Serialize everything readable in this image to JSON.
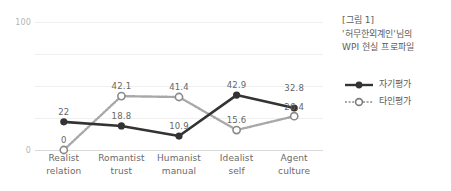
{
  "title": {
    "line1": "[그림 1]",
    "line2": "'허무한외계인'님의",
    "line3": "WPI 현실 프로파일"
  },
  "legend": [
    {
      "name": "self-evaluation",
      "label": "자기평가",
      "style": "solid",
      "marker": "filled-circle",
      "color": "#333333"
    },
    {
      "name": "other-evaluation",
      "label": "타인평가",
      "style": "dotted",
      "marker": "open-circle",
      "color": "#9a9a9a"
    }
  ],
  "axis": {
    "y_top_label": "100",
    "y_bottom_label": "0"
  },
  "colors": {
    "self_line": "#333333",
    "other_line": "#a8a8a8",
    "gridline": "#f0f0f0",
    "axis": "#d9d9d9",
    "text": "#6a6a6a"
  },
  "chart_data": {
    "type": "line",
    "title": "WPI 현실 프로파일",
    "xlabel": "",
    "ylabel": "",
    "ylim": [
      0,
      100
    ],
    "yticks": [
      0,
      100
    ],
    "grid": true,
    "legend_position": "right",
    "categories": [
      "Realist relation",
      "Romantist trust",
      "Humanist manual",
      "Idealist self",
      "Agent culture"
    ],
    "category_lines": [
      [
        "Realist",
        "relation"
      ],
      [
        "Romantist",
        "trust"
      ],
      [
        "Humanist",
        "manual"
      ],
      [
        "Idealist",
        "self"
      ],
      [
        "Agent",
        "culture"
      ]
    ],
    "series": [
      {
        "name": "자기평가",
        "values": [
          22,
          18.8,
          10.9,
          42.9,
          32.8
        ],
        "labels": [
          "22",
          "18.8",
          "10.9",
          "42.9",
          "32.8"
        ]
      },
      {
        "name": "타인평가",
        "values": [
          0,
          42.1,
          41.4,
          15.6,
          26.4
        ],
        "labels": [
          "0",
          "42.1",
          "41.4",
          "15.6",
          "26.4"
        ]
      }
    ]
  }
}
